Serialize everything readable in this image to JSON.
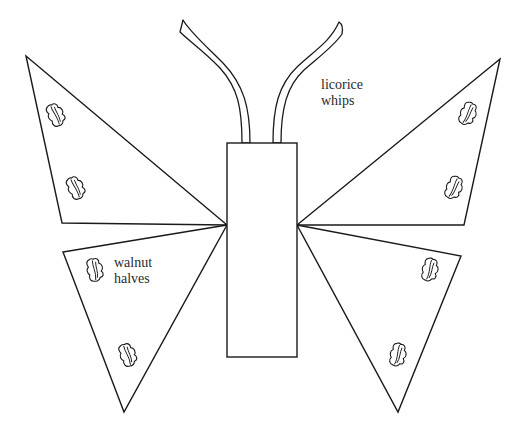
{
  "diagram": {
    "colors": {
      "stroke": "#1a1a1a",
      "fill": "#ffffff",
      "label_text": "#2a2a2a",
      "background": "#ffffff"
    },
    "labels": [
      {
        "id": "licorice",
        "lines": [
          "licorice",
          "whips"
        ]
      },
      {
        "id": "walnut",
        "lines": [
          "walnut",
          "halves"
        ]
      }
    ],
    "parts": {
      "body": {
        "name": "body rectangle"
      },
      "antennae": [
        {
          "name": "left licorice whip"
        },
        {
          "name": "right licorice whip"
        }
      ],
      "wings": [
        {
          "name": "upper-left wing",
          "walnuts": 2
        },
        {
          "name": "lower-left wing",
          "walnuts": 2
        },
        {
          "name": "upper-right wing",
          "walnuts": 2
        },
        {
          "name": "lower-right wing",
          "walnuts": 2
        }
      ]
    }
  }
}
